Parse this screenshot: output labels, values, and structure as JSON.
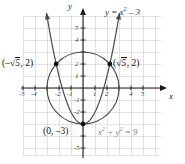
{
  "figure": {
    "kind": "cartesian-graph",
    "width": 185,
    "height": 164,
    "background": "#ffffff",
    "grid_color": "#d4d4d4",
    "axis_color": "#1a1a1a",
    "curve_color": "#4a4a4a",
    "point_color": "#111111"
  },
  "axes": {
    "x_name": "x",
    "y_name": "y",
    "x_ticks": [
      "-5",
      "-4",
      "-2",
      "-1",
      "1",
      "2",
      "4",
      "5"
    ],
    "x_tick_values": [
      -5,
      -4,
      -2,
      -1,
      1,
      2,
      4,
      5
    ],
    "y_ticks": [
      "5",
      "4",
      "2",
      "1",
      "-1",
      "-2",
      "-5"
    ],
    "y_tick_values": [
      5,
      4,
      2,
      1,
      -1,
      -2,
      -5
    ],
    "x_range": [
      -5.7,
      6.4
    ],
    "y_range": [
      -6.0,
      6.5
    ]
  },
  "labels": {
    "parabola_eq_prefix": "y = x",
    "parabola_eq_exp": "2",
    "parabola_eq_suffix": " – 3",
    "circle_eq_x": "x",
    "circle_eq_x_exp": "2",
    "circle_eq_plus": " + ",
    "circle_eq_y": "y",
    "circle_eq_y_exp": "2",
    "circle_eq_tail": " = 9",
    "point_left_open": "(–",
    "point_left_radical": "√",
    "point_left_arg": "5",
    "point_left_close": ", 2)",
    "point_right_open": "(",
    "point_right_radical": "√",
    "point_right_arg": "5",
    "point_right_close": ", 2)",
    "point_vertex": "(0, –3)"
  },
  "chart_data": {
    "type": "line",
    "title": "",
    "xlabel": "x",
    "ylabel": "y",
    "xlim": [
      -5.7,
      6.4
    ],
    "ylim": [
      -6.0,
      6.5
    ],
    "grid": true,
    "legend": "none",
    "series": [
      {
        "name": "y = x² – 3",
        "type": "parabola",
        "equation": "y = x^2 - 3",
        "vertex": [
          0,
          -3
        ],
        "points": [
          [
            -2.95,
            5.7
          ],
          [
            -2.75,
            4.56
          ],
          [
            -2.5,
            3.25
          ],
          [
            -2.25,
            2.06
          ],
          [
            -2.0,
            1.0
          ],
          [
            -1.75,
            0.06
          ],
          [
            -1.5,
            -0.75
          ],
          [
            -1.25,
            -1.44
          ],
          [
            -1.0,
            -2.0
          ],
          [
            -0.75,
            -2.44
          ],
          [
            -0.5,
            -2.75
          ],
          [
            -0.25,
            -2.94
          ],
          [
            0,
            -3.0
          ],
          [
            0.25,
            -2.94
          ],
          [
            0.5,
            -2.75
          ],
          [
            0.75,
            -2.44
          ],
          [
            1.0,
            -2.0
          ],
          [
            1.25,
            -1.44
          ],
          [
            1.5,
            -0.75
          ],
          [
            1.75,
            0.06
          ],
          [
            2.0,
            1.0
          ],
          [
            2.25,
            2.06
          ],
          [
            2.5,
            3.25
          ],
          [
            2.75,
            4.56
          ],
          [
            2.95,
            5.7
          ]
        ]
      },
      {
        "name": "x² + y² = 9",
        "type": "circle",
        "equation": "x^2 + y^2 = 9",
        "center": [
          0,
          0
        ],
        "radius": 3
      }
    ],
    "annotations": [
      {
        "text": "(–√5, 2)",
        "x": -2.2360679,
        "y": 2,
        "marker": true,
        "label_position": "left"
      },
      {
        "text": "(√5, 2)",
        "x": 2.2360679,
        "y": 2,
        "marker": true,
        "label_position": "right"
      },
      {
        "text": "(0, –3)",
        "x": 0,
        "y": -3,
        "marker": true,
        "label_position": "below-left"
      },
      {
        "text": "y = x² – 3",
        "x": 1.9,
        "y": 6.2,
        "marker": false,
        "label_position": "top"
      },
      {
        "text": "x² + y² = 9",
        "x": 1.5,
        "y": -4.1,
        "marker": false,
        "label_position": "bottom-right"
      }
    ],
    "intersections": [
      [
        -2.2360679,
        2
      ],
      [
        2.2360679,
        2
      ],
      [
        0,
        -3
      ]
    ]
  }
}
